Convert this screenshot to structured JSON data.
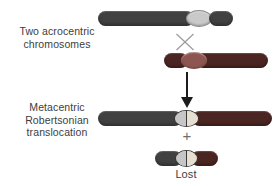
{
  "diagram": {
    "labels": {
      "top": "Two acrocentric\nchromosomes",
      "middle": "Metacentric\nRobertsonian\ntranslocation",
      "lost": "Lost"
    },
    "symbols": {
      "plus": "+"
    },
    "colors": {
      "background": "#ffffff",
      "text": "#3d3d3d",
      "gray_arm": "#414141",
      "gray_centromere": "#c9c9c9",
      "red_arm": "#4b2521",
      "red_centromere": "#8e5650",
      "fused_centromere_left": "#c6c6c6",
      "fused_centromere_right": "#e7dfd2",
      "arrow": "#1c1c1c",
      "cross_gray": "#9b9b9b",
      "plus_gray": "#6e6e6e"
    }
  }
}
